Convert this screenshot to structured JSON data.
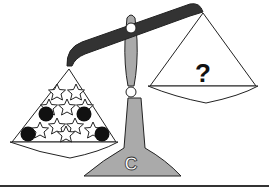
{
  "diagram": {
    "type": "balance-scale-puzzle",
    "base_label": "C",
    "right_pan_label": "?",
    "left_pan": {
      "stars": 10,
      "circles": 4
    },
    "colors": {
      "beam": "#333333",
      "post": "#aaaaaa",
      "outline": "#222222",
      "circle_fill": "#111111",
      "background": "#ffffff"
    }
  }
}
